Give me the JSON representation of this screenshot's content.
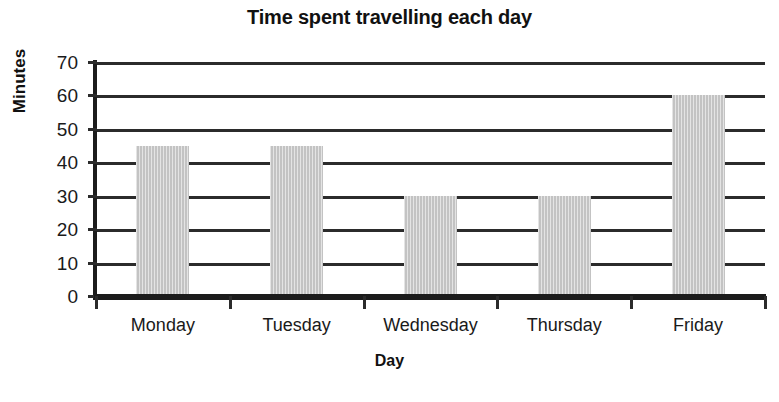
{
  "chart_data": {
    "type": "bar",
    "title": "Time spent travelling each day",
    "xlabel": "Day",
    "ylabel": "Minutes",
    "categories": [
      "Monday",
      "Tuesday",
      "Wednesday",
      "Thursday",
      "Friday"
    ],
    "values": [
      45,
      45,
      30,
      30,
      60
    ],
    "ylim": [
      0,
      70
    ],
    "ytick_step": 10,
    "ytick_labels": [
      "70",
      "60",
      "50",
      "40",
      "30",
      "20",
      "10",
      "0"
    ],
    "ytick_values": [
      70,
      60,
      50,
      40,
      30,
      20,
      10,
      0
    ],
    "grid": "horizontal",
    "legend": "none",
    "bar_color": "#c3c3c3",
    "axis_color": "#1c1c1c",
    "text_color": "#1a1a1a",
    "background": "#ffffff"
  }
}
